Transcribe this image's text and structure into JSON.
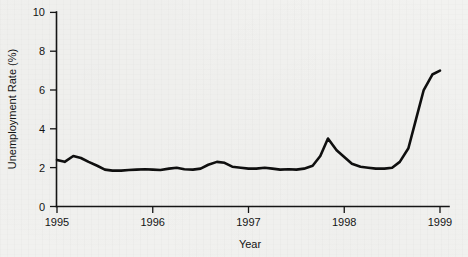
{
  "chart_data": {
    "type": "line",
    "title": "",
    "xlabel": "Year",
    "ylabel": "Unemployment Rate (%)",
    "xlim": [
      1995,
      1999
    ],
    "ylim": [
      0,
      10
    ],
    "xticks": [
      1995,
      1996,
      1997,
      1998,
      1999
    ],
    "xtick_labels": [
      "1995",
      "1996",
      "1997",
      "1998",
      "1999"
    ],
    "yticks": [
      0,
      2,
      4,
      6,
      8,
      10
    ],
    "ytick_labels": [
      "0",
      "2",
      "4",
      "6",
      "8",
      "10"
    ],
    "grid": false,
    "legend": false,
    "series": [
      {
        "name": "Unemployment Rate",
        "color": "#0f0f0f",
        "x": [
          1995.0,
          1995.08,
          1995.17,
          1995.25,
          1995.33,
          1995.42,
          1995.5,
          1995.58,
          1995.67,
          1995.75,
          1995.83,
          1995.92,
          1996.0,
          1996.08,
          1996.17,
          1996.25,
          1996.33,
          1996.42,
          1996.5,
          1996.58,
          1996.67,
          1996.75,
          1996.83,
          1996.92,
          1997.0,
          1997.08,
          1997.17,
          1997.25,
          1997.33,
          1997.42,
          1997.5,
          1997.58,
          1997.67,
          1997.75,
          1997.83,
          1997.92,
          1998.0,
          1998.08,
          1998.17,
          1998.25,
          1998.33,
          1998.42,
          1998.5,
          1998.58,
          1998.67,
          1998.75,
          1998.83,
          1998.92,
          1999.0
        ],
        "y": [
          2.4,
          2.3,
          2.6,
          2.5,
          2.3,
          2.1,
          1.9,
          1.85,
          1.85,
          1.88,
          1.9,
          1.92,
          1.9,
          1.88,
          1.95,
          2.0,
          1.92,
          1.9,
          1.95,
          2.15,
          2.3,
          2.25,
          2.05,
          2.0,
          1.95,
          1.95,
          2.0,
          1.95,
          1.9,
          1.92,
          1.9,
          1.95,
          2.1,
          2.6,
          3.5,
          2.9,
          2.55,
          2.2,
          2.05,
          2.0,
          1.95,
          1.95,
          2.0,
          2.3,
          3.0,
          4.5,
          6.0,
          6.8,
          7.0
        ]
      }
    ]
  },
  "axes": {
    "x_axis_name": "x-axis",
    "y_axis_name": "y-axis"
  }
}
